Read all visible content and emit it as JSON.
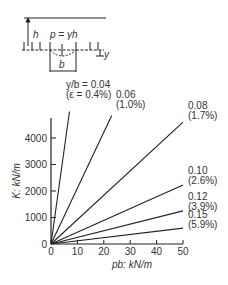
{
  "diagram": {
    "h_label": "h",
    "p_label": "p = γh",
    "b_label": "b",
    "y_label": "y"
  },
  "chart_data": {
    "type": "line",
    "title": "",
    "xlabel": "pb: kN/m",
    "ylabel": "K: kN/m",
    "xlim": [
      0,
      50
    ],
    "ylim": [
      0,
      4800
    ],
    "xticks": [
      0,
      10,
      20,
      30,
      40,
      50
    ],
    "yticks": [
      0,
      1000,
      2000,
      3000,
      4000
    ],
    "grid": false,
    "legend": "inline labels at line ends",
    "series": [
      {
        "name": "y/b = 0.04",
        "label1": "y/b = 0.04",
        "label2": "(ε = 0.4%)",
        "x": [
          0,
          7
        ],
        "y": [
          0,
          5000
        ]
      },
      {
        "name": "0.06",
        "label1": "0.06",
        "label2": "(1.0%)",
        "x": [
          0,
          23
        ],
        "y": [
          0,
          4850
        ]
      },
      {
        "name": "0.08",
        "label1": "0.08",
        "label2": "(1.7%)",
        "x": [
          0,
          50
        ],
        "y": [
          0,
          4600
        ]
      },
      {
        "name": "0.10",
        "label1": "0.10",
        "label2": "(2.6%)",
        "x": [
          0,
          50
        ],
        "y": [
          0,
          2230
        ]
      },
      {
        "name": "0.12",
        "label1": "0.12",
        "label2": "(3.9%)",
        "x": [
          0,
          50
        ],
        "y": [
          0,
          1250
        ]
      },
      {
        "name": "0.15",
        "label1": "0.15",
        "label2": "(5.9%)",
        "x": [
          0,
          50
        ],
        "y": [
          0,
          600
        ]
      }
    ]
  }
}
